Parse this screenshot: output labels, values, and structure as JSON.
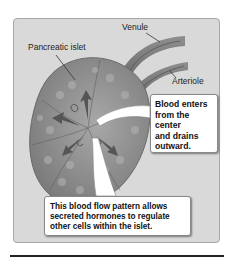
{
  "figure": {
    "labels": {
      "venule": "Venule",
      "pancreatic_islet": "Pancreatic islet",
      "arteriole": "Arteriole"
    },
    "callouts": {
      "blood_flow": {
        "lines": [
          "Blood enters",
          "from the",
          "center",
          "and drains",
          "outward."
        ]
      },
      "hormones": {
        "lines": [
          "This blood flow pattern allows",
          "secreted hormones to regulate",
          "other cells within the islet."
        ]
      }
    },
    "colors": {
      "panel_bg": "#d9d9d9",
      "islet_fill": "#8c8c8c",
      "vessel_fill": "#7a7a7a",
      "callout_bg": "#ffffff"
    }
  }
}
